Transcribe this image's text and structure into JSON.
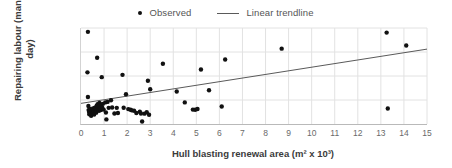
{
  "chart_data": {
    "type": "scatter",
    "title": "",
    "xlabel": "Hull blasting renewal area (m² x 10³)",
    "ylabel": "Repairing labour (man-day)",
    "xlim": [
      0,
      15
    ],
    "ylim": [
      0,
      10000
    ],
    "xticks": [
      "0",
      "1",
      "2",
      "3",
      "4",
      "5",
      "6",
      "7",
      "8",
      "9",
      "10",
      "11",
      "12",
      "13",
      "14",
      "15"
    ],
    "xtick_values": [
      0,
      1,
      2,
      3,
      4,
      5,
      6,
      7,
      8,
      9,
      10,
      11,
      12,
      13,
      14,
      15
    ],
    "yticks": [
      "0",
      "2,500",
      "5,000",
      "7,500",
      "10,000"
    ],
    "ytick_values": [
      0,
      2500,
      5000,
      7500,
      10000
    ],
    "grid": true,
    "grid_color": "#e2e2e2",
    "legend_position": "top-center",
    "marker_color": "#111111",
    "trendline_color": "#5a5a5a",
    "legend": [
      {
        "label": "Observed",
        "marker": "dot"
      },
      {
        "label": "Linear trendline",
        "marker": "line"
      }
    ],
    "series": [
      {
        "name": "Observed",
        "points": [
          [
            0.3,
            9600
          ],
          [
            0.28,
            5380
          ],
          [
            0.3,
            2820
          ],
          [
            0.32,
            1880
          ],
          [
            0.33,
            1450
          ],
          [
            0.35,
            1250
          ],
          [
            0.36,
            1020
          ],
          [
            0.38,
            1580
          ],
          [
            0.4,
            1350
          ],
          [
            0.42,
            1180
          ],
          [
            0.44,
            860
          ],
          [
            0.46,
            1500
          ],
          [
            0.48,
            1300
          ],
          [
            0.5,
            1100
          ],
          [
            0.52,
            1620
          ],
          [
            0.54,
            1400
          ],
          [
            0.55,
            1250
          ],
          [
            0.57,
            980
          ],
          [
            0.6,
            1700
          ],
          [
            0.62,
            1500
          ],
          [
            0.64,
            1350
          ],
          [
            0.66,
            1180
          ],
          [
            0.68,
            1900
          ],
          [
            0.7,
            6900
          ],
          [
            0.72,
            2050
          ],
          [
            0.74,
            1750
          ],
          [
            0.76,
            1550
          ],
          [
            0.78,
            1380
          ],
          [
            0.8,
            2200
          ],
          [
            0.82,
            1900
          ],
          [
            0.84,
            1650
          ],
          [
            0.86,
            1450
          ],
          [
            0.88,
            2000
          ],
          [
            0.9,
            4880
          ],
          [
            0.92,
            1700
          ],
          [
            0.95,
            2100
          ],
          [
            0.98,
            1500
          ],
          [
            1.05,
            2250
          ],
          [
            1.08,
            1200
          ],
          [
            1.1,
            480
          ],
          [
            1.15,
            2300
          ],
          [
            1.2,
            1680
          ],
          [
            1.3,
            2480
          ],
          [
            1.35,
            1720
          ],
          [
            1.45,
            1100
          ],
          [
            1.55,
            1680
          ],
          [
            1.6,
            1150
          ],
          [
            1.8,
            5120
          ],
          [
            1.85,
            1700
          ],
          [
            1.95,
            3100
          ],
          [
            2.05,
            1550
          ],
          [
            2.15,
            1480
          ],
          [
            2.2,
            1420
          ],
          [
            2.3,
            1380
          ],
          [
            2.4,
            1150
          ],
          [
            2.55,
            1280
          ],
          [
            2.6,
            1100
          ],
          [
            2.65,
            260
          ],
          [
            2.75,
            1080
          ],
          [
            2.85,
            1220
          ],
          [
            2.9,
            4500
          ],
          [
            2.95,
            960
          ],
          [
            3.0,
            3620
          ],
          [
            3.55,
            6280
          ],
          [
            4.15,
            3380
          ],
          [
            4.5,
            2250
          ],
          [
            4.85,
            1500
          ],
          [
            4.95,
            1480
          ],
          [
            5.05,
            1560
          ],
          [
            5.2,
            5680
          ],
          [
            5.55,
            3520
          ],
          [
            6.1,
            1820
          ],
          [
            6.25,
            6720
          ],
          [
            8.7,
            7850
          ],
          [
            13.25,
            9520
          ],
          [
            13.3,
            1620
          ],
          [
            14.1,
            8180
          ]
        ]
      }
    ],
    "trendline": {
      "name": "Linear trendline",
      "x0": 0.0,
      "y0": 2150,
      "x1": 15.0,
      "y1": 7800
    }
  }
}
